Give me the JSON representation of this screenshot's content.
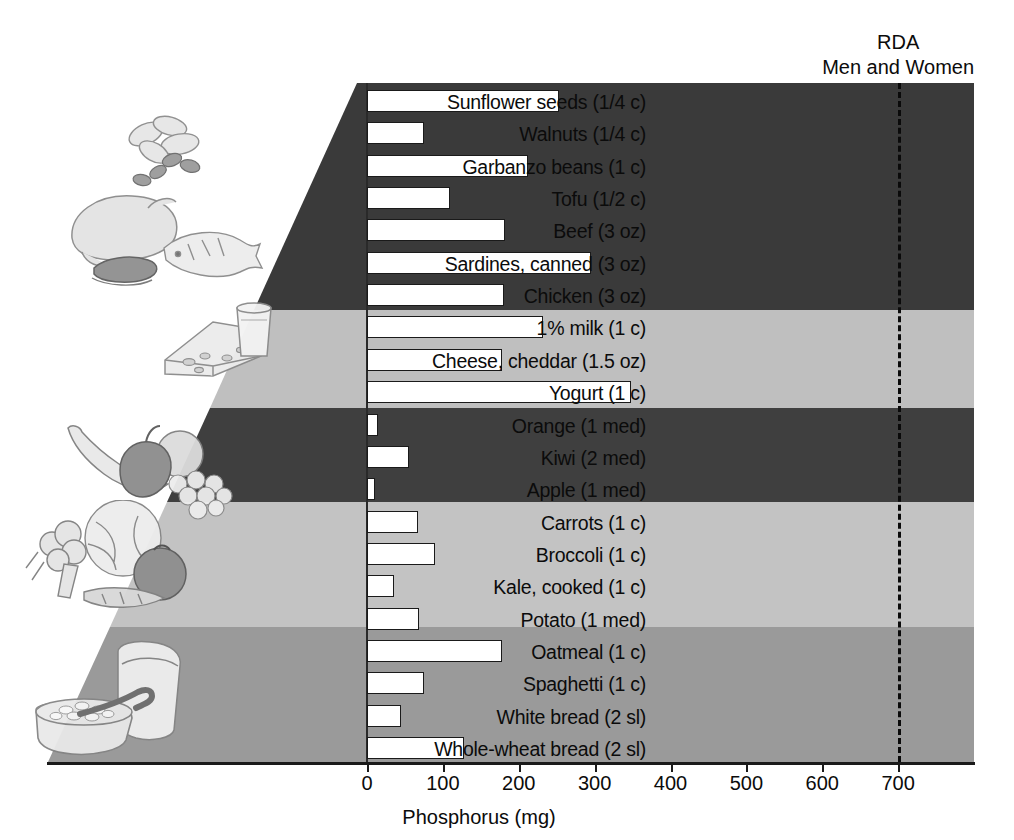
{
  "chart_data": {
    "type": "bar",
    "orientation": "horizontal",
    "title": "",
    "xlabel": "Phosphorus (mg)",
    "ylabel": "",
    "xlim": [
      0,
      800
    ],
    "xticks": [
      0,
      100,
      200,
      300,
      400,
      500,
      600,
      700
    ],
    "grid": false,
    "legend": "none",
    "categories": [
      "Sunflower seeds (1/4 c)",
      "Walnuts (1/4 c)",
      "Garbanzo beans (1 c)",
      "Tofu (1/2 c)",
      "Beef (3 oz)",
      "Sardines, canned (3 oz)",
      "Chicken (3 oz)",
      "1% milk (1 c)",
      "Cheese, cheddar (1.5 oz)",
      "Yogurt (1 c)",
      "Orange (1 med)",
      "Kiwi (2 med)",
      "Apple (1 med)",
      "Carrots (1 c)",
      "Broccoli (1 c)",
      "Kale, cooked (1 c)",
      "Potato (1 med)",
      "Oatmeal (1 c)",
      "Spaghetti (1 c)",
      "White bread (2 sl)",
      "Whole-wheat bread (2 sl)"
    ],
    "values": [
      253,
      75,
      212,
      110,
      182,
      295,
      180,
      232,
      178,
      348,
      15,
      55,
      10,
      67,
      90,
      35,
      68,
      178,
      75,
      45,
      128
    ],
    "annotations": [
      {
        "name": "rda-reference-line",
        "value": 700,
        "label_line1": "RDA",
        "label_line2": "Men and Women",
        "style": "dashed"
      }
    ],
    "groups": [
      {
        "name": "protein",
        "rows": 7,
        "shade": "#3a3a3a"
      },
      {
        "name": "dairy",
        "rows": 3,
        "shade": "#bfbfbf"
      },
      {
        "name": "fruits",
        "rows": 3,
        "shade": "#3a3a3a"
      },
      {
        "name": "vegetables",
        "rows": 4,
        "shade": "#c3c3c3"
      },
      {
        "name": "grains",
        "rows": 4,
        "shade": "#9a9a9a"
      }
    ]
  },
  "axis": {
    "x_title": "Phosphorus (mg)",
    "tick_labels": [
      "0",
      "100",
      "200",
      "300",
      "400",
      "500",
      "600",
      "700"
    ]
  },
  "rda": {
    "line1": "RDA",
    "line2": "Men and Women",
    "value_mg": 700
  },
  "illustrations": [
    {
      "name": "nuts-and-seeds-illustration",
      "group": "protein"
    },
    {
      "name": "poultry-fish-meat-illustration",
      "group": "protein"
    },
    {
      "name": "cheese-and-milk-illustration",
      "group": "dairy"
    },
    {
      "name": "fruit-banana-apple-grapes-illustration",
      "group": "fruits"
    },
    {
      "name": "vegetables-broccoli-lettuce-tomato-carrot-illustration",
      "group": "vegetables"
    },
    {
      "name": "bread-and-oatmeal-bowl-illustration",
      "group": "grains"
    }
  ],
  "colors": {
    "bar_fill": "#ffffff",
    "bar_stroke": "#1a1a1a",
    "band_dark": "#3a3a3a",
    "band_light": "#bfbfbf",
    "band_medium": "#9a9a9a",
    "text": "#0b0b0b",
    "axis": "#1a1a1a"
  }
}
